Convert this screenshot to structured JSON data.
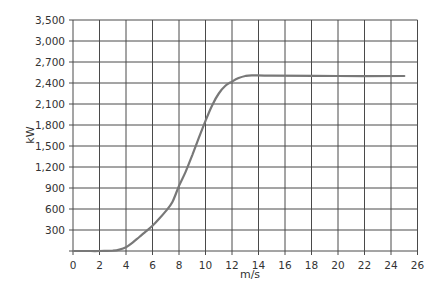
{
  "chart_data": {
    "type": "line",
    "title": "",
    "xlabel": "m/s",
    "ylabel": "kW",
    "xlim": [
      0,
      26
    ],
    "ylim": [
      0,
      3300
    ],
    "grid": true,
    "legend": null,
    "x_ticks": [
      0,
      2,
      4,
      6,
      8,
      10,
      12,
      14,
      16,
      18,
      20,
      22,
      24,
      26
    ],
    "x_tick_labels": [
      "0",
      "2",
      "4",
      "6",
      "8",
      "10",
      "12",
      "14",
      "16",
      "18",
      "20",
      "22",
      "24",
      "26"
    ],
    "y_ticks": [
      300,
      600,
      900,
      1200,
      1500,
      1800,
      2100,
      2400,
      2700,
      3000,
      3300
    ],
    "y_tick_labels": [
      "300",
      "600",
      "900",
      "1,200",
      "1,500",
      "1,800",
      "2,100",
      "2,400",
      "2,700",
      "3,000",
      "3,500"
    ],
    "series": [
      {
        "name": "Power curve",
        "color": "#787878",
        "x": [
          0,
          1,
          2,
          3,
          3.5,
          4,
          4.5,
          5,
          5.5,
          6,
          6.5,
          7,
          7.5,
          8,
          8.5,
          9,
          9.5,
          10,
          10.5,
          11,
          11.5,
          12,
          12.5,
          13,
          13.5,
          15,
          20,
          25
        ],
        "y": [
          0,
          0,
          0,
          5,
          20,
          55,
          120,
          200,
          280,
          360,
          460,
          570,
          700,
          930,
          1130,
          1370,
          1620,
          1860,
          2080,
          2250,
          2360,
          2420,
          2470,
          2500,
          2510,
          2505,
          2500,
          2500
        ]
      }
    ],
    "colors": {
      "grid": "#4a4a4a",
      "curve": "#787878",
      "text": "#333333",
      "background": "#ffffff"
    }
  }
}
